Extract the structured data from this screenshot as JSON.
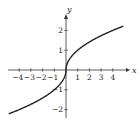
{
  "chart_data": {
    "type": "line",
    "title": "",
    "xlabel": "x",
    "ylabel": "y",
    "xlim": [
      -5.5,
      5.5
    ],
    "ylim": [
      -2.4,
      2.6
    ],
    "x_ticks": [
      -4,
      -3,
      -2,
      -1,
      1,
      2,
      3,
      4
    ],
    "x_tick_labels": [
      "−4",
      "−3",
      "−2",
      "−1",
      "1",
      "2",
      "3",
      "4"
    ],
    "y_ticks": [
      -2,
      -1,
      1,
      2
    ],
    "y_tick_labels": [
      "−2",
      "−1",
      "1",
      "2"
    ],
    "grid": false,
    "legend": null,
    "series": [
      {
        "name": "y = sign(x)·√|x|",
        "x": [
          -4.9,
          -4,
          -3,
          -2,
          -1,
          -0.5,
          -0.25,
          -0.1,
          -0.02,
          0,
          0.02,
          0.1,
          0.25,
          0.5,
          1,
          2,
          3,
          4,
          4.9
        ],
        "y": [
          -2.21,
          -2.0,
          -1.73,
          -1.41,
          -1.0,
          -0.71,
          -0.5,
          -0.32,
          -0.14,
          0,
          0.14,
          0.32,
          0.5,
          0.71,
          1.0,
          1.41,
          1.73,
          2.0,
          2.21
        ]
      }
    ],
    "colors": {
      "curve": "#222222",
      "axis": "#333333",
      "text": "#222222"
    }
  }
}
